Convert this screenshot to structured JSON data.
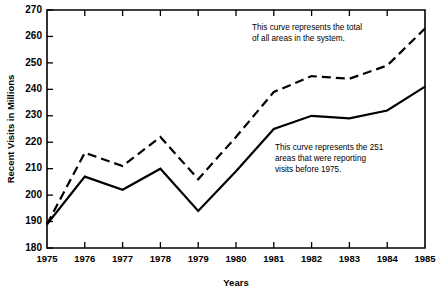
{
  "chart_data": {
    "type": "line",
    "title": "",
    "xlabel": "Years",
    "ylabel": "Recent Visits in Millions",
    "x": [
      1975,
      1976,
      1977,
      1978,
      1979,
      1980,
      1981,
      1982,
      1983,
      1984,
      1985
    ],
    "xtick_labels": [
      "1975",
      "1976",
      "1977",
      "1978",
      "1979",
      "1980",
      "1981",
      "1982",
      "1983",
      "1984",
      "1985"
    ],
    "ytick_labels": [
      "180",
      "190",
      "200",
      "210",
      "220",
      "230",
      "240",
      "250",
      "260",
      "270"
    ],
    "yticks": [
      180,
      190,
      200,
      210,
      220,
      230,
      240,
      250,
      260,
      270
    ],
    "ylim": [
      180,
      270
    ],
    "xlim": [
      1975,
      1985
    ],
    "grid": false,
    "legend_position": "none",
    "series": [
      {
        "name": "Total of all areas in the system",
        "style": "dashed",
        "values": [
          189,
          216,
          211,
          222,
          206,
          222,
          239,
          245,
          244,
          249,
          263
        ]
      },
      {
        "name": "251 areas reporting visits before 1975",
        "style": "solid",
        "values": [
          189,
          207,
          202,
          210,
          194,
          209,
          225,
          230,
          229,
          232,
          241
        ]
      }
    ],
    "annotations": [
      {
        "id": "annotation-total",
        "text": "This curve represents the total of all areas in the system.",
        "lines": [
          "This curve represents the total",
          "of all areas in the system."
        ]
      },
      {
        "id": "annotation-reporting",
        "text": "This curve represents the 251 areas that were reporting visits before 1975.",
        "lines": [
          "This curve represents the 251",
          "areas that were reporting",
          "visits before 1975."
        ]
      }
    ]
  }
}
